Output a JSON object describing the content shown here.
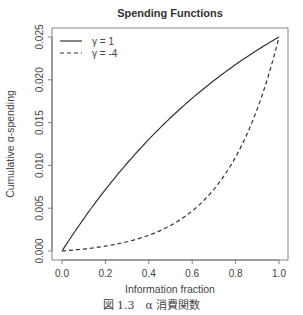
{
  "chart_data": {
    "type": "line",
    "title": "Spending Functions",
    "xlabel": "Information fraction",
    "ylabel": "Cumulative α-spending",
    "xlim": [
      0,
      1
    ],
    "ylim": [
      0,
      0.025
    ],
    "xticks": [
      "0.0",
      "0.2",
      "0.4",
      "0.6",
      "0.8",
      "1.0"
    ],
    "xtick_values": [
      0,
      0.2,
      0.4,
      0.6,
      0.8,
      1.0
    ],
    "yticks": [
      "0.000",
      "0.005",
      "0.010",
      "0.015",
      "0.020",
      "0.025"
    ],
    "ytick_values": [
      0,
      0.005,
      0.01,
      0.015,
      0.02,
      0.025
    ],
    "grid": false,
    "legend_position": "top-left",
    "alpha": 0.025,
    "x": [
      0,
      0.1,
      0.2,
      0.3,
      0.4,
      0.5,
      0.6,
      0.7,
      0.8,
      0.9,
      1.0
    ],
    "series": [
      {
        "name": "γ = 1",
        "gamma": 1,
        "linestyle": "solid",
        "values": [
          0,
          0.00376,
          0.00717,
          0.01025,
          0.01304,
          0.01556,
          0.01784,
          0.01991,
          0.02178,
          0.02347,
          0.025
        ]
      },
      {
        "name": "γ = -4",
        "gamma": -4,
        "linestyle": "dashed",
        "values": [
          0,
          0.00023,
          0.00057,
          0.00107,
          0.00182,
          0.00293,
          0.00459,
          0.00706,
          0.01075,
          0.01625,
          0.025
        ]
      }
    ]
  },
  "caption": "図 1.3　α 消費関数"
}
